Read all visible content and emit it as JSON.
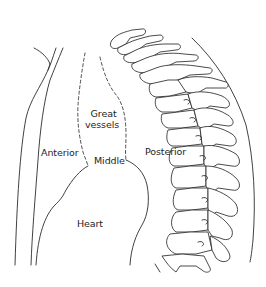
{
  "diagram": {
    "labels": {
      "great_vessels_line1": "Great",
      "great_vessels_line2": "vessels",
      "anterior": "Anterior",
      "middle": "Middle",
      "posterior": "Posterior",
      "heart": "Heart"
    },
    "colors": {
      "line": "#2b2b2b",
      "text": "#1e1e1e",
      "background": "#ffffff"
    },
    "structures": [
      "sternum-outline",
      "great-vessels-dashed-boundary",
      "heart-outline",
      "thoracic-spine-vertebrae",
      "posterior-chest-wall"
    ]
  }
}
